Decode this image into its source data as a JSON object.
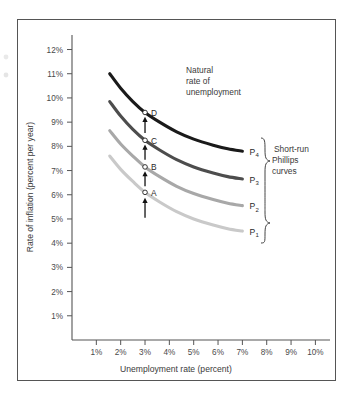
{
  "chart_data": {
    "type": "line",
    "title": "",
    "xlabel": "Unemployment rate (percent)",
    "ylabel": "Rate of inflation (percent per year)",
    "xlim": [
      0,
      10.6
    ],
    "ylim": [
      0,
      12.6
    ],
    "xticks": [
      "1%",
      "2%",
      "3%",
      "4%",
      "5%",
      "6%",
      "7%",
      "8%",
      "9%",
      "10%"
    ],
    "xtick_values": [
      1,
      2,
      3,
      4,
      5,
      6,
      7,
      8,
      9,
      10
    ],
    "yticks": [
      "1%",
      "2%",
      "3%",
      "4%",
      "5%",
      "6%",
      "7%",
      "8%",
      "9%",
      "10%",
      "11%",
      "12%"
    ],
    "ytick_values": [
      1,
      2,
      3,
      4,
      5,
      6,
      7,
      8,
      9,
      10,
      11,
      12
    ],
    "grid": false,
    "legend_position": "right-of-curves",
    "series": [
      {
        "name": "P4",
        "label": "P",
        "subscript": "4",
        "color": "#1a1a1a",
        "x": [
          1.55,
          2.0,
          2.5,
          3.0,
          3.6,
          4.3,
          5.0,
          5.8,
          6.4,
          7.0
        ],
        "y": [
          11.0,
          10.4,
          9.85,
          9.4,
          9.0,
          8.6,
          8.3,
          8.05,
          7.9,
          7.8
        ]
      },
      {
        "name": "P3",
        "label": "P",
        "subscript": "3",
        "color": "#4d4d4d",
        "x": [
          1.55,
          2.0,
          2.5,
          3.0,
          3.6,
          4.3,
          5.0,
          5.8,
          6.4,
          7.0
        ],
        "y": [
          9.85,
          9.25,
          8.7,
          8.25,
          7.85,
          7.45,
          7.15,
          6.9,
          6.75,
          6.65
        ]
      },
      {
        "name": "P2",
        "label": "P",
        "subscript": "2",
        "color": "#a8a8a8",
        "x": [
          1.55,
          2.0,
          2.5,
          3.0,
          3.6,
          4.3,
          5.0,
          5.8,
          6.4,
          7.0
        ],
        "y": [
          8.65,
          8.1,
          7.6,
          7.15,
          6.75,
          6.35,
          6.05,
          5.8,
          5.65,
          5.55
        ]
      },
      {
        "name": "P1",
        "label": "P",
        "subscript": "1",
        "color": "#c9c9c9",
        "x": [
          1.55,
          2.0,
          2.5,
          3.0,
          3.6,
          4.3,
          5.0,
          5.8,
          6.4,
          7.0
        ],
        "y": [
          7.6,
          7.05,
          6.55,
          6.1,
          5.7,
          5.3,
          5.0,
          4.75,
          4.6,
          4.5
        ]
      }
    ],
    "points": [
      {
        "label": "A",
        "x": 3.0,
        "y": 6.1,
        "series": "P1"
      },
      {
        "label": "B",
        "x": 3.0,
        "y": 7.15,
        "series": "P2"
      },
      {
        "label": "C",
        "x": 3.0,
        "y": 8.25,
        "series": "P3"
      },
      {
        "label": "D",
        "x": 3.0,
        "y": 9.4,
        "series": "P4"
      }
    ],
    "arrows": [
      {
        "x": 3.0,
        "from_y": 5.05,
        "to_y": 5.85,
        "direction": "up"
      },
      {
        "x": 3.0,
        "from_y": 6.35,
        "to_y": 6.95,
        "direction": "up"
      },
      {
        "x": 3.0,
        "from_y": 7.45,
        "to_y": 8.05,
        "direction": "up"
      },
      {
        "x": 3.0,
        "from_y": 8.55,
        "to_y": 9.2,
        "direction": "up"
      }
    ],
    "annotations": [
      {
        "name": "natural-rate",
        "lines": [
          "Natural",
          "rate of",
          "unemployment"
        ],
        "x": 4.6,
        "y": 10.85
      },
      {
        "name": "short-run-phillips",
        "lines": [
          "Short-run",
          "Phillips",
          "curves"
        ],
        "x": 7.9,
        "y": 7.0
      }
    ]
  },
  "axes": {
    "y_title": "Rate of inflation (percent per year)",
    "x_title": "Unemployment rate (percent)",
    "y_tick_labels": [
      "12%",
      "11%",
      "10%",
      "9%",
      "8%",
      "7%",
      "6%",
      "5%",
      "4%",
      "3%",
      "2%",
      "1%"
    ],
    "x_tick_labels": [
      "1%",
      "2%",
      "3%",
      "4%",
      "5%",
      "6%",
      "7%",
      "8%",
      "9%",
      "10%"
    ]
  },
  "curve_labels": [
    {
      "base": "P",
      "sub": "4"
    },
    {
      "base": "P",
      "sub": "3"
    },
    {
      "base": "P",
      "sub": "2"
    },
    {
      "base": "P",
      "sub": "1"
    }
  ],
  "point_labels": [
    "D",
    "C",
    "B",
    "A"
  ],
  "natural_rate_note": {
    "line1": "Natural",
    "line2": "rate of",
    "line3": "unemployment"
  },
  "phillips_note": {
    "line1": "Short-run",
    "line2": "Phillips",
    "line3": "curves"
  },
  "colors": {
    "p4": "#1a1a1a",
    "p3": "#4d4d4d",
    "p2": "#a8a8a8",
    "p1": "#c9c9c9",
    "axis": "#555555",
    "text": "#3a3a3a",
    "frame": "#555555",
    "background": "#ffffff"
  }
}
